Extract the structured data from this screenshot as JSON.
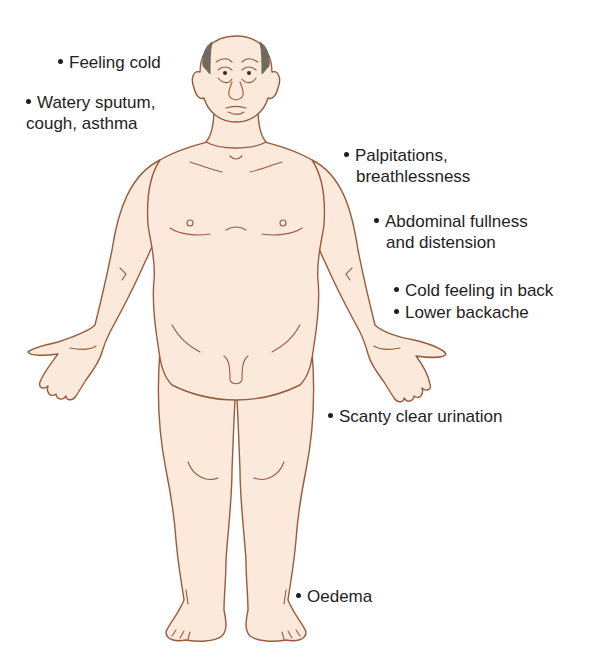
{
  "diagram": {
    "colors": {
      "skin_fill": "#fbeadb",
      "outline": "#9a5a3c",
      "hair": "#6f6a5e",
      "text": "#1e1e1e",
      "background": "#ffffff"
    },
    "labels": [
      {
        "id": "feeling-cold",
        "lines": [
          "Feeling cold"
        ]
      },
      {
        "id": "watery-sputum",
        "lines": [
          "Watery sputum,",
          "cough, asthma"
        ]
      },
      {
        "id": "palpitations",
        "lines": [
          "Palpitations,",
          "breathlessness"
        ]
      },
      {
        "id": "abdominal-fullness",
        "lines": [
          "Abdominal fullness",
          "and distension"
        ]
      },
      {
        "id": "cold-back",
        "lines": [
          "Cold feeling in back"
        ]
      },
      {
        "id": "lower-backache",
        "lines": [
          "Lower backache"
        ]
      },
      {
        "id": "scanty-urination",
        "lines": [
          "Scanty clear urination"
        ]
      },
      {
        "id": "oedema",
        "lines": [
          "Oedema"
        ]
      }
    ]
  }
}
